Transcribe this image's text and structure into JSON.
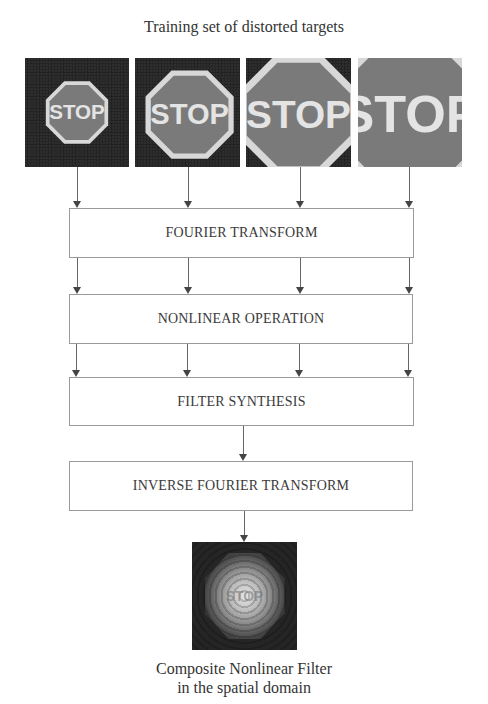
{
  "title": "Training set of distorted targets",
  "training_images": [
    {
      "label": "STOP",
      "scale": 0.3
    },
    {
      "label": "STOP",
      "scale": 0.42
    },
    {
      "label": "STOP",
      "scale": 0.58
    },
    {
      "label": "STOP",
      "scale": 0.78
    }
  ],
  "steps": [
    {
      "label": "FOURIER TRANSFORM"
    },
    {
      "label": "NONLINEAR OPERATION"
    },
    {
      "label": "FILTER SYNTHESIS"
    },
    {
      "label": "INVERSE FOURIER TRANSFORM"
    }
  ],
  "output": {
    "ghost_label": "STOP",
    "caption_line1": "Composite Nonlinear Filter",
    "caption_line2": "in the spatial domain"
  },
  "colors": {
    "image_background": "#262626",
    "sign_fill": "#7a7a7a",
    "sign_border": "#d8d8d8",
    "box_border": "#9a9a9a",
    "arrow": "#444444"
  }
}
